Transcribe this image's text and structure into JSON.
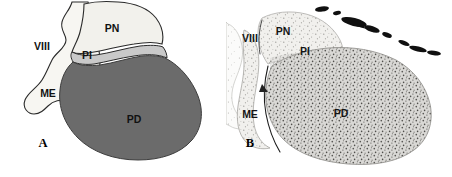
{
  "figure": {
    "panels": [
      {
        "letter": "A",
        "type": "schematic-diagram",
        "description": "Line drawing of sagittal pituitary gland with shaded lobes",
        "labels": [
          {
            "key": "viii",
            "text": "VIII",
            "x": 42,
            "y": 50
          },
          {
            "key": "pn",
            "text": "PN",
            "x": 112,
            "y": 32
          },
          {
            "key": "pi",
            "text": "PI",
            "x": 87,
            "y": 57
          },
          {
            "key": "me",
            "text": "ME",
            "x": 48,
            "y": 97
          },
          {
            "key": "pd",
            "text": "PD",
            "x": 134,
            "y": 123
          }
        ],
        "regions": [
          {
            "key": "pn",
            "name": "pars-nervosa",
            "fill": "#f2f1ec",
            "stroke": "#2a2a2a"
          },
          {
            "key": "pi",
            "name": "pars-intermedia",
            "fill": "#c9c9c9",
            "stroke": "#2a2a2a"
          },
          {
            "key": "pd",
            "name": "pars-distalis",
            "fill": "#6b6b6b",
            "stroke": "#3c3c3c"
          },
          {
            "key": "me",
            "name": "median-eminence",
            "fill": "#f7f6f2",
            "stroke": "#2a2a2a"
          }
        ]
      },
      {
        "letter": "B",
        "type": "histology-micrograph",
        "description": "Brightfield histological section of pituitary gland, counterstained",
        "labels": [
          {
            "key": "viii",
            "text": "VIII",
            "x": 24,
            "y": 42
          },
          {
            "key": "pn",
            "text": "PN",
            "x": 57,
            "y": 35
          },
          {
            "key": "pi",
            "text": "PI",
            "x": 79,
            "y": 55
          },
          {
            "key": "me",
            "text": "ME",
            "x": 24,
            "y": 118
          },
          {
            "key": "pd",
            "text": "PD",
            "x": 115,
            "y": 117
          }
        ],
        "tissue": {
          "background": "#ffffff",
          "parenchyma_fill": "#d6d5d2",
          "light_lobe_fill": "#f0efec",
          "speckle_color": "#555552",
          "vessel_color": "#111111"
        }
      }
    ],
    "abbreviations": [
      {
        "code": "PN",
        "meaning": "pars nervosa"
      },
      {
        "code": "PI",
        "meaning": "pars intermedia"
      },
      {
        "code": "PD",
        "meaning": "pars distalis"
      },
      {
        "code": "ME",
        "meaning": "median eminence"
      },
      {
        "code": "VIII",
        "meaning": "third ventricle"
      }
    ]
  }
}
